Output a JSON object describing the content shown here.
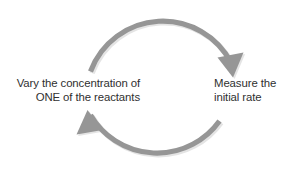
{
  "diagram": {
    "type": "cycle-diagram",
    "title": "",
    "background_color": "#ffffff",
    "arrow_color": "#969696",
    "arrow_shadow_color": "#bfbfbf",
    "text_color": "#2f2f2f",
    "steps": [
      {
        "id": "vary-concentration",
        "position": "left",
        "text": "Vary the concentration of\nONE of the reactants",
        "line_1": "Vary the concentration of",
        "line_2": "ONE of the reactants"
      },
      {
        "id": "measure-rate",
        "position": "right",
        "text": "Measure the\ninitial rate",
        "line_1": "Measure the",
        "line_2": "initial rate"
      }
    ],
    "arrows": [
      {
        "id": "top-arrow",
        "from": "vary-concentration",
        "to": "measure-rate",
        "direction": "clockwise",
        "head_name": "arrowhead-down-right"
      },
      {
        "id": "bottom-arrow",
        "from": "measure-rate",
        "to": "vary-concentration",
        "direction": "clockwise",
        "head_name": "arrowhead-up-left"
      }
    ]
  }
}
